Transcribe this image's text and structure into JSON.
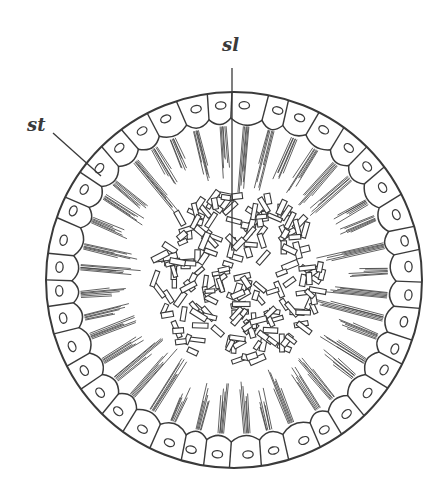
{
  "figure": {
    "type": "biological cross-section diagram",
    "background": "#ffffff",
    "stroke_color": "#3a3a3a",
    "labels": [
      {
        "id": "sl",
        "text": "sl",
        "x": 222,
        "y": 36,
        "leader": {
          "x1": 232,
          "y1": 68,
          "x2": 232,
          "y2": 246
        }
      },
      {
        "id": "st",
        "text": "st",
        "x": 27,
        "y": 116,
        "leader": {
          "x1": 53,
          "y1": 133,
          "x2": 101,
          "y2": 176
        }
      }
    ],
    "outer_sphere": {
      "cx": 234,
      "cy": 280,
      "r": 188
    },
    "cell_layer": {
      "inner_r": 160,
      "cell_count": 40,
      "nucleus_rx": 3.6,
      "nucleus_ry": 5.2
    },
    "fiber_bundles": {
      "count": 40,
      "min_len": 38,
      "max_len": 72,
      "lines_per_bundle": 6
    },
    "central_mass": {
      "cx": 236,
      "cy": 278,
      "r": 86,
      "crystal_count": 190,
      "crystal_len": [
        9,
        18
      ],
      "crystal_w": [
        4,
        6
      ]
    }
  }
}
